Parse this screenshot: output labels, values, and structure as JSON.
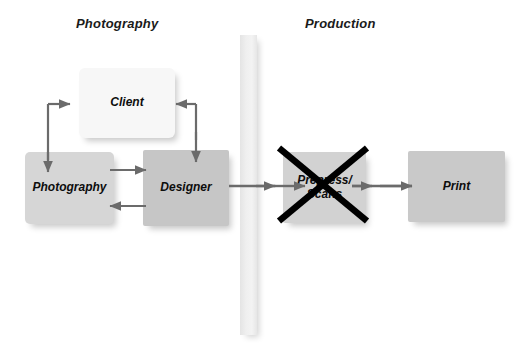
{
  "diagram": {
    "titles": [
      {
        "id": "photography",
        "label": "Photography"
      },
      {
        "id": "production",
        "label": "Production"
      }
    ],
    "nodes": [
      {
        "id": "client",
        "label": "Client",
        "fill": "#f7f7f7"
      },
      {
        "id": "photography",
        "label": "Photography",
        "fill": "#d6d6d6"
      },
      {
        "id": "designer",
        "label": "Designer",
        "fill": "#c6c6c6"
      },
      {
        "id": "prepress",
        "label_line1": "Prepress/",
        "label_line2": "Scans",
        "fill": "#d2d2d2",
        "struck_out": true
      },
      {
        "id": "print",
        "label": "Print",
        "fill": "#c9c9c9"
      }
    ],
    "divider": {
      "id": "phase-divider",
      "fill": "#efefef"
    },
    "connector_color": "#6b6b6b",
    "strikeout_color": "#000000",
    "background": "#ffffff"
  }
}
